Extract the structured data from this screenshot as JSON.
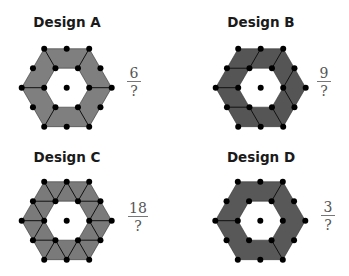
{
  "designs": [
    {
      "title": "Design A",
      "numerator": "6",
      "denominator": "?",
      "fill": "#7f7f7f",
      "cx": 66.7,
      "cy": 87.7,
      "pieces": 6
    },
    {
      "title": "Design B",
      "numerator": "9",
      "denominator": "?",
      "fill": "#555555",
      "cx": 260.7,
      "cy": 87.7,
      "pieces": 9
    },
    {
      "title": "Design C",
      "numerator": "18",
      "denominator": "?",
      "fill": "#7a7a7a",
      "cx": 66.7,
      "cy": 220.7,
      "pieces": 24
    },
    {
      "title": "Design D",
      "numerator": "3",
      "denominator": "?",
      "fill": "#585858",
      "cx": 260.3,
      "cy": 220.7,
      "pieces": 3
    }
  ]
}
